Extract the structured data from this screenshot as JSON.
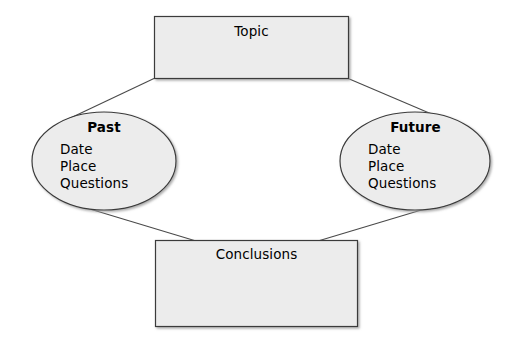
{
  "diagram": {
    "type": "cycle-flowchart",
    "background_color": "#ffffff",
    "shape_fill_color": "#ececec",
    "shape_stroke_color": "#3a3a3a",
    "connector_color": "#4a4a4a",
    "text_color": "#000000",
    "nodes": {
      "topic": {
        "label": "Topic",
        "shape": "rectangle"
      },
      "past": {
        "heading": "Past",
        "shape": "ellipse",
        "items": [
          "Date",
          "Place",
          "Questions"
        ]
      },
      "future": {
        "heading": "Future",
        "shape": "ellipse",
        "items": [
          "Date",
          "Place",
          "Questions"
        ]
      },
      "conclusions": {
        "label": "Conclusions",
        "shape": "rectangle"
      }
    },
    "connectors": [
      {
        "from": "topic",
        "to": "past"
      },
      {
        "from": "topic",
        "to": "future"
      },
      {
        "from": "past",
        "to": "conclusions"
      },
      {
        "from": "future",
        "to": "conclusions"
      }
    ]
  }
}
